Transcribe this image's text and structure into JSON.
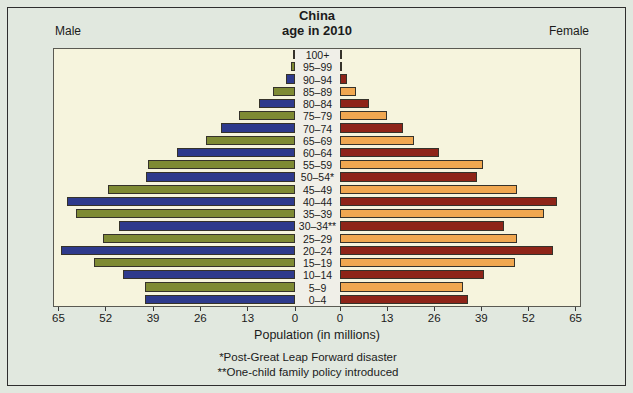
{
  "figure": {
    "title_line1": "China",
    "title_line2": "age in 2010",
    "left_group_label": "Male",
    "right_group_label": "Female",
    "xlabel": "Population (in millions)",
    "footnote1": "*Post-Great Leap Forward disaster",
    "footnote2": "**One-child family policy introduced"
  },
  "chart_data": {
    "type": "bar",
    "subtype": "population-pyramid",
    "title": "China age in 2010",
    "categories_top_to_bottom": [
      "100+",
      "95–99",
      "90–94",
      "85–89",
      "80–84",
      "75–79",
      "70–74",
      "65–69",
      "60–64",
      "55–59",
      "50–54*",
      "45–49",
      "40–44",
      "35–39",
      "30–34**",
      "25–29",
      "20–24",
      "15–19",
      "10–14",
      "5–9",
      "0–4"
    ],
    "series": [
      {
        "name": "Male",
        "side": "left",
        "values_millions": [
          0.2,
          1.0,
          2.5,
          6.0,
          10.0,
          15.5,
          20.5,
          24.5,
          32.5,
          40.5,
          41.0,
          51.5,
          63.0,
          60.5,
          48.5,
          53.0,
          64.5,
          55.5,
          47.5,
          41.5,
          41.5
        ]
      },
      {
        "name": "Female",
        "side": "right",
        "values_millions": [
          0.1,
          0.3,
          2.0,
          4.5,
          8.0,
          13.0,
          17.5,
          20.5,
          27.5,
          39.5,
          38.0,
          49.0,
          60.0,
          56.5,
          45.5,
          49.0,
          59.0,
          48.5,
          40.0,
          34.0,
          35.5
        ]
      }
    ],
    "xlabel": "Population (in millions)",
    "axis_ticks": [
      0,
      13,
      26,
      39,
      52,
      65
    ],
    "xlim_each_side": [
      0,
      66.5
    ],
    "grid": false,
    "legend": "none",
    "annotations": [
      "*Post-Great Leap Forward disaster",
      "**One-child family policy introduced"
    ],
    "colors": {
      "male_primary_navy": "#2e3a8c",
      "male_secondary_olive": "#7e8a33",
      "female_primary_maroon": "#8e2418",
      "female_secondary_orange": "#f0a750",
      "plot_background": "#f6f4dd",
      "center_strip_background": "#f0efe8",
      "page_background": "#e1e8df",
      "bar_outline": "#35322a"
    }
  }
}
